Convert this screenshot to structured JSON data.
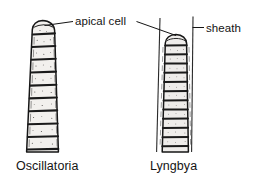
{
  "figure": {
    "kind": "scientific-line-drawing",
    "background_color": "#ffffff",
    "ink_color": "#141414",
    "callouts": [
      {
        "id": "apical-cell",
        "label": "apical cell"
      },
      {
        "id": "sheath",
        "label": "sheath"
      }
    ],
    "specimens": [
      {
        "id": "oscillatoria",
        "label": "Oscillatoria",
        "has_sheath": false,
        "apex": "rounded, slightly capitate",
        "visible_cells": 10
      },
      {
        "id": "lyngbya",
        "label": "Lyngbya",
        "has_sheath": true,
        "apex": "rounded",
        "visible_cells": 12
      }
    ]
  },
  "labels": {
    "apical_cell": "apical cell",
    "sheath": "sheath",
    "oscillatoria": "Oscillatoria",
    "lyngbya": "Lyngbya"
  }
}
